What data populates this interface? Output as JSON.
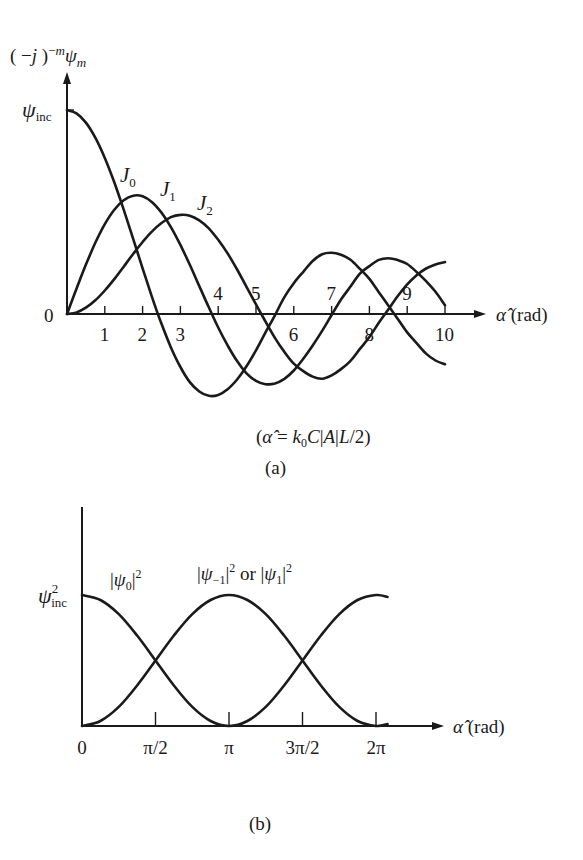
{
  "figure": {
    "panel_a": {
      "caption": "(a)",
      "formula": "(α̂ = k₀C|A|L/2)",
      "y_axis_label": "(−j)⁻ᵐψₘ",
      "y_ref_label": "ψ_inc",
      "x_axis_label": "α̂ (rad)",
      "origin_label": "0",
      "tick_labels": [
        "1",
        "2",
        "3",
        "4",
        "5",
        "6",
        "7",
        "8",
        "9",
        "10"
      ],
      "curve_labels": [
        "J0",
        "J1",
        "J2"
      ]
    },
    "panel_b": {
      "caption": "(b)",
      "y_ref_label": "ψ²_inc",
      "x_axis_label": "α̂ (rad)",
      "tick_labels": [
        "0",
        "π/2",
        "π",
        "3π/2",
        "2π"
      ],
      "curve_labels": [
        "|ψ0|²",
        "|ψ−1|² or |ψ1|²"
      ]
    }
  },
  "chart_data": [
    {
      "type": "line",
      "title": "(a)",
      "subtitle": "(α̂ = k0 C|A|L/2)",
      "xlabel": "α̂ (rad)",
      "ylabel": "(−j)^(−m) ψ_m",
      "xlim": [
        0,
        10
      ],
      "ylim": [
        -0.45,
        1.05
      ],
      "y_reference": {
        "label": "ψ_inc",
        "value": 1.0
      },
      "x_ticks": [
        1,
        2,
        3,
        4,
        5,
        6,
        7,
        8,
        9,
        10
      ],
      "grid": false,
      "legend": "inline labels J0, J1, J2",
      "x": [
        0,
        0.25,
        0.5,
        0.75,
        1,
        1.25,
        1.5,
        1.75,
        2,
        2.25,
        2.5,
        2.75,
        3,
        3.25,
        3.5,
        3.75,
        4,
        4.25,
        4.5,
        4.75,
        5,
        5.25,
        5.5,
        5.75,
        6,
        6.25,
        6.5,
        6.75,
        7,
        7.25,
        7.5,
        7.75,
        8,
        8.25,
        8.5,
        8.75,
        9,
        9.25,
        9.5,
        9.75,
        10
      ],
      "series": [
        {
          "name": "J0",
          "values": [
            1.0,
            0.984,
            0.938,
            0.864,
            0.765,
            0.646,
            0.512,
            0.369,
            0.224,
            0.082,
            -0.048,
            -0.164,
            -0.26,
            -0.334,
            -0.38,
            -0.401,
            -0.397,
            -0.369,
            -0.321,
            -0.256,
            -0.178,
            -0.091,
            -0.007,
            0.083,
            0.151,
            0.207,
            0.26,
            0.293,
            0.3,
            0.29,
            0.266,
            0.221,
            0.172,
            0.107,
            0.042,
            -0.024,
            -0.09,
            -0.143,
            -0.194,
            -0.228,
            -0.246
          ]
        },
        {
          "name": "J1",
          "values": [
            0.0,
            0.124,
            0.242,
            0.349,
            0.44,
            0.511,
            0.558,
            0.58,
            0.577,
            0.548,
            0.497,
            0.426,
            0.339,
            0.241,
            0.137,
            0.033,
            -0.066,
            -0.154,
            -0.231,
            -0.291,
            -0.328,
            -0.344,
            -0.341,
            -0.318,
            -0.277,
            -0.219,
            -0.154,
            -0.083,
            -0.005,
            0.071,
            0.135,
            0.198,
            0.235,
            0.265,
            0.273,
            0.264,
            0.245,
            0.206,
            0.161,
            0.109,
            0.043
          ]
        },
        {
          "name": "J2",
          "values": [
            0.0,
            0.008,
            0.031,
            0.067,
            0.115,
            0.171,
            0.232,
            0.294,
            0.353,
            0.405,
            0.446,
            0.475,
            0.486,
            0.482,
            0.459,
            0.42,
            0.364,
            0.297,
            0.218,
            0.133,
            0.047,
            -0.036,
            -0.117,
            -0.186,
            -0.243,
            -0.28,
            -0.307,
            -0.317,
            -0.301,
            -0.27,
            -0.23,
            -0.171,
            -0.113,
            -0.043,
            0.022,
            0.088,
            0.145,
            0.19,
            0.223,
            0.243,
            0.255
          ]
        }
      ]
    },
    {
      "type": "line",
      "title": "(b)",
      "xlabel": "α̂ (rad)",
      "ylabel": "",
      "xlim": [
        0,
        6.53
      ],
      "ylim": [
        0,
        1.05
      ],
      "y_reference": {
        "label": "ψ²_inc",
        "value": 1.0
      },
      "x_tick_labels": [
        "0",
        "π/2",
        "π",
        "3π/2",
        "2π"
      ],
      "x_ticks": [
        0,
        1.5708,
        3.1416,
        4.7124,
        6.2832
      ],
      "grid": false,
      "legend": "inline labels",
      "x": [
        0,
        0.3927,
        0.7854,
        1.1781,
        1.5708,
        1.9635,
        2.3562,
        2.7489,
        3.1416,
        3.5343,
        3.927,
        4.3197,
        4.7124,
        5.1051,
        5.4978,
        5.8905,
        6.2832,
        6.53
      ],
      "series": [
        {
          "name": "|ψ0|²",
          "values": [
            1.0,
            0.962,
            0.854,
            0.691,
            0.5,
            0.309,
            0.146,
            0.038,
            0.0,
            0.038,
            0.146,
            0.309,
            0.5,
            0.691,
            0.854,
            0.962,
            1.0,
            0.985
          ],
          "note": "drawn 0→π falling then rising per cos²(α̂/2)"
        },
        {
          "name": "|ψ−1|² or |ψ1|²",
          "values": [
            0.0,
            0.038,
            0.146,
            0.309,
            0.5,
            0.691,
            0.854,
            0.962,
            1.0,
            0.962,
            0.854,
            0.691,
            0.5,
            0.309,
            0.146,
            0.038,
            0.0,
            0.015
          ]
        }
      ]
    }
  ]
}
